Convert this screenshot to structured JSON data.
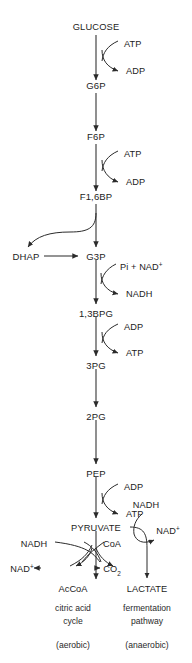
{
  "diagram": {
    "line_color": "#2b2b2b",
    "text_color": "#1c1c1c",
    "background": "#ffffff",
    "backbone": [
      {
        "id": "glucose",
        "label": "GLUCOSE",
        "x": 96,
        "y": 30
      },
      {
        "id": "g6p",
        "label": "G6P",
        "x": 96,
        "y": 89
      },
      {
        "id": "f6p",
        "label": "F6P",
        "x": 96,
        "y": 140
      },
      {
        "id": "f16bp",
        "label": "F1,6BP",
        "x": 96,
        "y": 200
      },
      {
        "id": "g3p",
        "label": "G3P",
        "x": 96,
        "y": 256
      },
      {
        "id": "bpg13",
        "label": "1,3BPG",
        "x": 96,
        "y": 313
      },
      {
        "id": "pg3",
        "label": "3PG",
        "x": 96,
        "y": 365
      },
      {
        "id": "pg2",
        "label": "2PG",
        "x": 96,
        "y": 416
      },
      {
        "id": "pep",
        "label": "PEP",
        "x": 96,
        "y": 473
      },
      {
        "id": "pyruvate",
        "label": "PYRUVATE",
        "x": 96,
        "y": 527
      }
    ],
    "side_nodes": [
      {
        "id": "dhap",
        "label": "DHAP",
        "x": 26,
        "y": 256
      },
      {
        "id": "accoa",
        "label": "AcCoA",
        "x": 73,
        "y": 588
      },
      {
        "id": "lactate",
        "label": "LACTATE",
        "x": 147,
        "y": 588
      }
    ],
    "cofactors": [
      {
        "id": "atp-in-1",
        "label": "ATP",
        "x": 124,
        "y": 47,
        "anchor": "start"
      },
      {
        "id": "adp-out-1",
        "label": "ADP",
        "x": 126,
        "y": 74,
        "anchor": "start"
      },
      {
        "id": "atp-in-2",
        "label": "ATP",
        "x": 124,
        "y": 157,
        "anchor": "start"
      },
      {
        "id": "adp-out-2",
        "label": "ADP",
        "x": 126,
        "y": 185,
        "anchor": "start"
      },
      {
        "id": "pi-nad-in",
        "label": "Pi + NAD",
        "sup": "+",
        "x": 120,
        "y": 270,
        "anchor": "start"
      },
      {
        "id": "nadh-out",
        "label": "NADH",
        "x": 126,
        "y": 297,
        "anchor": "start"
      },
      {
        "id": "adp-in-3",
        "label": "ADP",
        "x": 124,
        "y": 330,
        "anchor": "start"
      },
      {
        "id": "atp-out-3",
        "label": "ATP",
        "x": 126,
        "y": 356,
        "anchor": "start"
      },
      {
        "id": "adp-in-4",
        "label": "ADP",
        "x": 124,
        "y": 490,
        "anchor": "start"
      },
      {
        "id": "atp-out-4",
        "label": "ATP",
        "x": 126,
        "y": 517,
        "anchor": "start"
      },
      {
        "id": "nadh-ferment-in",
        "label": "NADH",
        "x": 146,
        "y": 508,
        "anchor": "middle"
      },
      {
        "id": "nad-ferment-out",
        "label": "NAD",
        "sup": "+",
        "x": 168,
        "y": 534,
        "anchor": "middle"
      },
      {
        "id": "nadh-pdh-in",
        "label": "NADH",
        "x": 34,
        "y": 547,
        "anchor": "middle"
      },
      {
        "id": "coa-pdh-in",
        "label": "CoA",
        "x": 110,
        "y": 547,
        "anchor": "middle"
      },
      {
        "id": "nad-pdh-out",
        "label": "NAD",
        "sup": "+",
        "x": 24,
        "y": 572,
        "anchor": "middle"
      },
      {
        "id": "co2-pdh-out",
        "label": "CO",
        "sub": "2",
        "x": 110,
        "y": 572,
        "anchor": "middle"
      }
    ],
    "captions": [
      {
        "id": "citric-acid-cycle-line1",
        "label": "citric acid",
        "x": 73,
        "y": 611
      },
      {
        "id": "citric-acid-cycle-line2",
        "label": "cycle",
        "x": 73,
        "y": 624
      },
      {
        "id": "aerobic-label",
        "label": "(aerobic)",
        "x": 73,
        "y": 648
      },
      {
        "id": "fermentation-line1",
        "label": "fermentation",
        "x": 147,
        "y": 611
      },
      {
        "id": "fermentation-line2",
        "label": "pathway",
        "x": 147,
        "y": 624
      },
      {
        "id": "anaerobic-label",
        "label": "(anaerobic)",
        "x": 147,
        "y": 648
      }
    ]
  }
}
